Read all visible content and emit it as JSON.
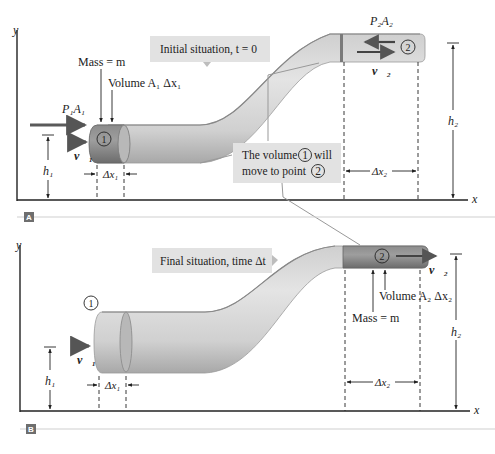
{
  "panel_a": {
    "tag": "A",
    "callout_initial": "Initial situation, t = 0",
    "callout_move_line1": "The volume",
    "callout_move_num1": "1",
    "callout_move_word": "will",
    "callout_move_line2": "move to point",
    "callout_move_num2": "2",
    "mass_label": "Mass = m",
    "volume_label": "Volume A₁ Δx₁",
    "force1_label": "P₁A₁",
    "force2_label": "P₂A₂",
    "v1_label": "v⃗₁",
    "v2_label": "v⃗₂",
    "h1_label": "h₁",
    "h2_label": "h₂",
    "dx1_label": "Δx₁",
    "dx2_label": "Δx₂",
    "point1": "1",
    "point2": "2",
    "axis_x": "x",
    "axis_y": "y"
  },
  "panel_b": {
    "tag": "B",
    "callout_final": "Final situation, time Δt",
    "mass_label": "Mass = m",
    "volume_label": "Volume A₂ Δx₂",
    "v1_label": "v⃗₁",
    "v2_label": "v⃗₂",
    "h1_label": "h₁",
    "h2_label": "h₂",
    "dx1_label": "Δx₁",
    "dx2_label": "Δx₂",
    "point1": "1",
    "point2": "2",
    "axis_x": "x",
    "axis_y": "y"
  },
  "colors": {
    "tube_light": "#d8d8d8",
    "tube_mid": "#bdbdbd",
    "tube_dark": "#8a8a8a",
    "fluid_volume": "#7a7a7a",
    "callout_bg": "#e2e2e2",
    "arrow": "#5a5a5a",
    "panel_tag_bg": "#6e6e6e"
  }
}
